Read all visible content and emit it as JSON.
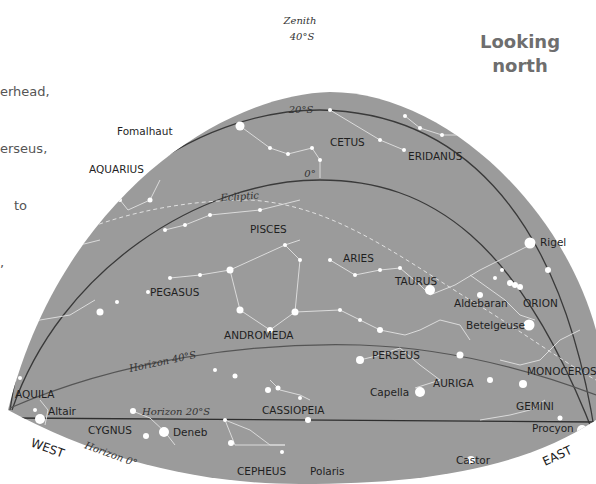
{
  "intro_text": [
    "erhead,",
    "erseus,",
    "to",
    ","
  ],
  "title": [
    "Looking",
    "north"
  ],
  "colors": {
    "sky": "#9b9b9b",
    "star": "#ffffff",
    "line": "#e6e6e6",
    "arc": "#3a3a3a",
    "title": "#6e6e6e"
  },
  "zenith": {
    "label": "Zenith",
    "lat": "40°S"
  },
  "arcs": {
    "lat20": "20°S",
    "lat0": "0°",
    "ecliptic": "Ecliptic",
    "horizon40": "Horizon 40°S",
    "horizon20": "Horizon 20°S",
    "horizon0": "Horizon 0°"
  },
  "directions": {
    "west": "WEST",
    "east": "EAST"
  },
  "constellations": [
    "CETUS",
    "ERIDANUS",
    "AQUARIUS",
    "PISCES",
    "ARIES",
    "TAURUS",
    "ORION",
    "PEGASUS",
    "ANDROMEDA",
    "PERSEUS",
    "AURIGA",
    "MONOCEROS",
    "GEMINI",
    "AQUILA",
    "CYGNUS",
    "CASSIOPEIA",
    "CEPHEUS"
  ],
  "stars": [
    "Fomalhaut",
    "Rigel",
    "Aldebaran",
    "Betelgeuse",
    "Capella",
    "Altair",
    "Deneb",
    "Procyon",
    "Castor",
    "Polaris"
  ]
}
